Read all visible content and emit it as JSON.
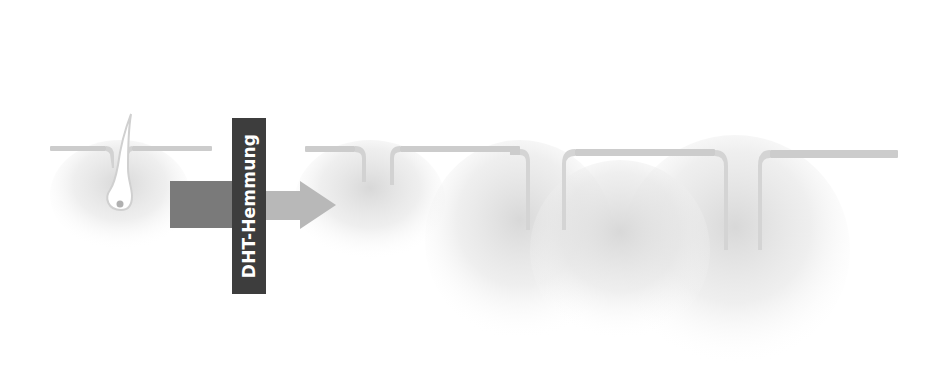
{
  "diagram": {
    "type": "hair-follicle-growth-sequence",
    "label": "DHT-Hemmung",
    "stages": [
      {
        "id": "stage-1",
        "name": "miniaturized-follicle",
        "hair_color": "#ffffff",
        "size": "small"
      },
      {
        "id": "stage-2",
        "name": "thin-hair-follicle",
        "hair_color": "#6e6e6e",
        "size": "small-medium"
      },
      {
        "id": "stage-3",
        "name": "medium-hair-follicle",
        "hair_color": "#505050",
        "size": "medium"
      },
      {
        "id": "stage-4",
        "name": "full-hair-follicle",
        "hair_color": "#1e1e1e",
        "size": "large"
      }
    ],
    "arrows": [
      {
        "id": "big-arrow",
        "from": "stage-1",
        "to": "stage-2",
        "color": "#7a7a7a",
        "head_color": "#b8b8b8"
      },
      {
        "id": "arrow-2",
        "from": "stage-2",
        "to": "stage-3",
        "color": "#555555"
      },
      {
        "id": "arrow-3",
        "from": "stage-3",
        "to": "stage-4",
        "color": "#555555"
      }
    ],
    "colors": {
      "skin_line": "#cccccc",
      "shadow": "#d8d8d8",
      "label_box": "#3d3d3d",
      "label_text": "#ffffff"
    }
  }
}
